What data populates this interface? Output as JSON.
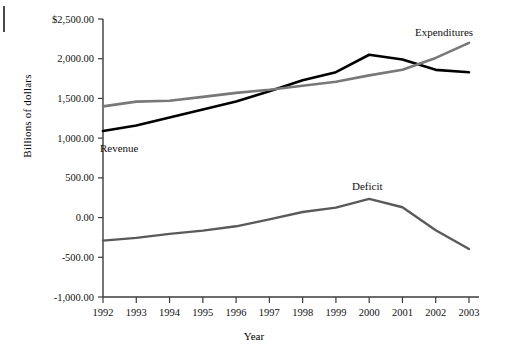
{
  "chart_data": {
    "type": "line",
    "title": "",
    "xlabel": "Year",
    "ylabel": "Billions of dollars",
    "x": [
      1992,
      1993,
      1994,
      1995,
      1996,
      1997,
      1998,
      1999,
      2000,
      2001,
      2002,
      2003
    ],
    "categories": [
      "1992",
      "1993",
      "1994",
      "1995",
      "1996",
      "1997",
      "1998",
      "1999",
      "2000",
      "2001",
      "2002",
      "2003"
    ],
    "xlim": [
      1992,
      2003
    ],
    "ylim": [
      -1000,
      2500
    ],
    "ytick_values": [
      -1000,
      -500,
      0,
      500,
      1000,
      1500,
      2000,
      2500
    ],
    "ytick_labels": [
      "-1,000.00",
      "-500.00",
      "0.00",
      "500.00",
      "1,000.00",
      "1,500.00",
      "2,000.00",
      "$2,500.00"
    ],
    "grid": false,
    "legend": "inline-annotations",
    "series": [
      {
        "name": "Revenue",
        "color": "#000000",
        "width": 2.6,
        "values": [
          1090,
          1160,
          1260,
          1360,
          1460,
          1590,
          1730,
          1830,
          2050,
          1990,
          1860,
          1830
        ]
      },
      {
        "name": "Expenditures",
        "color": "#787878",
        "width": 2.6,
        "values": [
          1400,
          1460,
          1470,
          1520,
          1570,
          1610,
          1660,
          1710,
          1790,
          1860,
          2010,
          2200
        ]
      },
      {
        "name": "Deficit",
        "color": "#5a5a5a",
        "width": 2.4,
        "values": [
          -290,
          -255,
          -205,
          -165,
          -110,
          -22,
          70,
          125,
          235,
          130,
          -160,
          -395
        ]
      }
    ],
    "annotations": [
      {
        "text": "Expenditures",
        "x_px": 415,
        "y_px": 36,
        "anchor": "start"
      },
      {
        "text": "Revenue",
        "x_px": 100,
        "y_px": 152,
        "anchor": "start"
      },
      {
        "text": "Deficit",
        "x_px": 352,
        "y_px": 190,
        "anchor": "start"
      }
    ],
    "axis_geometry": {
      "left_px": 103,
      "right_px": 469,
      "top_px": 19,
      "bottom_px": 297
    }
  }
}
